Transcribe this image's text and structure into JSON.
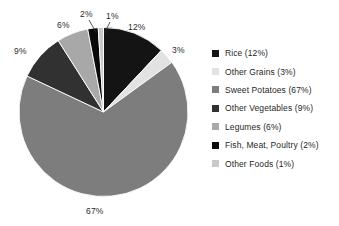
{
  "chart_data": {
    "type": "pie",
    "title": "",
    "labels": [
      "Rice",
      "Other Grains",
      "Sweet Potatoes",
      "Other Vegetables",
      "Legumes",
      "Fish, Meat, Poultry",
      "Other Foods"
    ],
    "values": [
      12,
      3,
      67,
      9,
      6,
      2,
      1
    ],
    "value_labels": [
      "12%",
      "3%",
      "67%",
      "9%",
      "6%",
      "2%",
      "1%"
    ],
    "units": "percent",
    "start_angle_deg": 0,
    "direction": "clockwise",
    "legend_position": "right",
    "grid": false,
    "colors": [
      "#141414",
      "#e2e2e2",
      "#7d7d7d",
      "#313131",
      "#a8a8a8",
      "#0a0a0a",
      "#c9c9c9"
    ],
    "slices": [
      {
        "label": "Rice",
        "value": 12,
        "value_label": "12%",
        "color": "#141414",
        "legend_label": "Rice (12%)"
      },
      {
        "label": "Other Grains",
        "value": 3,
        "value_label": "3%",
        "color": "#e2e2e2",
        "legend_label": "Other Grains (3%)"
      },
      {
        "label": "Sweet Potatoes",
        "value": 67,
        "value_label": "67%",
        "color": "#7d7d7d",
        "legend_label": "Sweet Potatoes (67%)"
      },
      {
        "label": "Other Vegetables",
        "value": 9,
        "value_label": "9%",
        "color": "#313131",
        "legend_label": "Other Vegetables (9%)"
      },
      {
        "label": "Legumes",
        "value": 6,
        "value_label": "6%",
        "color": "#a8a8a8",
        "legend_label": "Legumes (6%)"
      },
      {
        "label": "Fish, Meat, Poultry",
        "value": 2,
        "value_label": "2%",
        "color": "#0a0a0a",
        "legend_label": "Fish, Meat, Poultry (2%)"
      },
      {
        "label": "Other Foods",
        "value": 1,
        "value_label": "1%",
        "color": "#c9c9c9",
        "legend_label": "Other Foods (1%)"
      }
    ]
  },
  "legend": {
    "items": [
      {
        "label": "Rice (12%)",
        "color": "#141414"
      },
      {
        "label": "Other Grains (3%)",
        "color": "#e2e2e2"
      },
      {
        "label": "Sweet Potatoes (67%)",
        "color": "#7d7d7d"
      },
      {
        "label": "Other Vegetables (9%)",
        "color": "#313131"
      },
      {
        "label": "Legumes (6%)",
        "color": "#a8a8a8"
      },
      {
        "label": "Fish, Meat, Poultry (2%)",
        "color": "#0a0a0a"
      },
      {
        "label": "Other Foods (1%)",
        "color": "#c9c9c9"
      }
    ]
  },
  "slice_labels": [
    {
      "text": "12%",
      "x": 128,
      "y": 22
    },
    {
      "text": "3%",
      "x": 172,
      "y": 45
    },
    {
      "text": "67%",
      "x": 86,
      "y": 206
    },
    {
      "text": "9%",
      "x": 14,
      "y": 46
    },
    {
      "text": "6%",
      "x": 57,
      "y": 20
    },
    {
      "text": "2%",
      "x": 82,
      "y": 9
    },
    {
      "text": "1%",
      "x": 107,
      "y": 11
    }
  ]
}
